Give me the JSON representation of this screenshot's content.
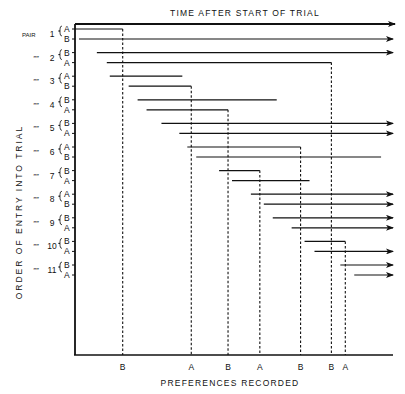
{
  "chart_data": {
    "type": "timeline",
    "title": "TIME AFTER START OF TRIAL",
    "xlabel": "PREFERENCES RECORDED",
    "ylabel": "ORDER OF ENTRY INTO TRIAL",
    "time_units": "arbitrary (relative to start of trial)",
    "time_range": [
      0,
      320
    ],
    "pair_prefix": "PAIR",
    "ditto_mark": "”",
    "pairs": [
      {
        "pair": 1,
        "members": [
          {
            "label": "A",
            "start": 0,
            "end": 48,
            "ongoing": false
          },
          {
            "label": "B",
            "start": 4,
            "end": 320,
            "ongoing": true
          }
        ]
      },
      {
        "pair": 2,
        "members": [
          {
            "label": "B",
            "start": 22,
            "end": 320,
            "ongoing": true
          },
          {
            "label": "A",
            "start": 32,
            "end": 258,
            "ongoing": false
          }
        ]
      },
      {
        "pair": 3,
        "members": [
          {
            "label": "A",
            "start": 35,
            "end": 108,
            "ongoing": false
          },
          {
            "label": "B",
            "start": 54,
            "end": 117,
            "ongoing": false
          }
        ]
      },
      {
        "pair": 4,
        "members": [
          {
            "label": "B",
            "start": 63,
            "end": 203,
            "ongoing": false
          },
          {
            "label": "A",
            "start": 72,
            "end": 154,
            "ongoing": false
          }
        ]
      },
      {
        "pair": 5,
        "members": [
          {
            "label": "B",
            "start": 87,
            "end": 320,
            "ongoing": true
          },
          {
            "label": "A",
            "start": 105,
            "end": 320,
            "ongoing": true
          }
        ]
      },
      {
        "pair": 6,
        "members": [
          {
            "label": "A",
            "start": 113,
            "end": 227,
            "ongoing": false
          },
          {
            "label": "B",
            "start": 122,
            "end": 308,
            "ongoing": false
          }
        ]
      },
      {
        "pair": 7,
        "members": [
          {
            "label": "B",
            "start": 145,
            "end": 186,
            "ongoing": false
          },
          {
            "label": "A",
            "start": 158,
            "end": 236,
            "ongoing": false
          }
        ]
      },
      {
        "pair": 8,
        "members": [
          {
            "label": "A",
            "start": 177,
            "end": 320,
            "ongoing": true
          },
          {
            "label": "B",
            "start": 190,
            "end": 320,
            "ongoing": true
          }
        ]
      },
      {
        "pair": 9,
        "members": [
          {
            "label": "B",
            "start": 199,
            "end": 320,
            "ongoing": true
          },
          {
            "label": "A",
            "start": 218,
            "end": 320,
            "ongoing": true
          }
        ]
      },
      {
        "pair": 10,
        "members": [
          {
            "label": "B",
            "start": 231,
            "end": 272,
            "ongoing": false
          },
          {
            "label": "A",
            "start": 241,
            "end": 320,
            "ongoing": true
          }
        ]
      },
      {
        "pair": 11,
        "members": [
          {
            "label": "B",
            "start": 267,
            "end": 320,
            "ongoing": true
          },
          {
            "label": "A",
            "start": 281,
            "end": 320,
            "ongoing": true
          }
        ]
      }
    ],
    "preferences": [
      {
        "time": 48,
        "label": "B"
      },
      {
        "time": 117,
        "label": "A"
      },
      {
        "time": 154,
        "label": "B"
      },
      {
        "time": 186,
        "label": "A"
      },
      {
        "time": 227,
        "label": "B"
      },
      {
        "time": 258,
        "label": "B"
      },
      {
        "time": 272,
        "label": "A"
      }
    ]
  }
}
